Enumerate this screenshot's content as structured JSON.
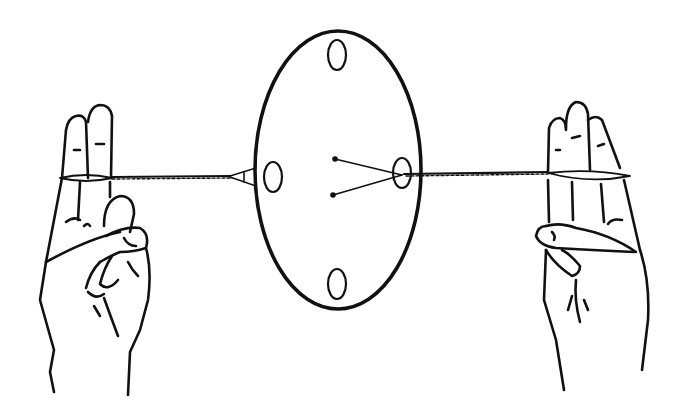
{
  "illustration": {
    "subject": "button whirligig toy held on twisted string between two hands",
    "background_color": "#ffffff",
    "ink_color": "#111111",
    "parts": {
      "disc": "oval disc with four holes",
      "string": "twisted string passing through two holes",
      "left_hand": "left hand, two fingers extended holding string loop",
      "right_hand": "right hand, three fingers extended holding string loop"
    }
  }
}
